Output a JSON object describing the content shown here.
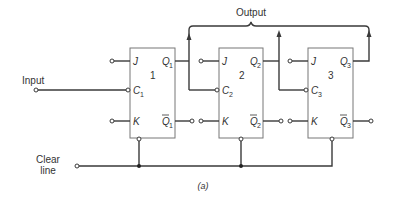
{
  "diagram": {
    "title": "Output",
    "caption": "(a)",
    "input_label": "Input",
    "clear_label_line1": "Clear",
    "clear_label_line2": "line",
    "flipflops": [
      {
        "number": "1",
        "j": "J",
        "c": "C",
        "c_sub": "1",
        "k": "K",
        "q": "Q",
        "q_sub": "1",
        "qbar": "Q",
        "qbar_sub": "1"
      },
      {
        "number": "2",
        "j": "J",
        "c": "C",
        "c_sub": "2",
        "k": "K",
        "q": "Q",
        "q_sub": "2",
        "qbar": "Q",
        "qbar_sub": "2"
      },
      {
        "number": "3",
        "j": "J",
        "c": "C",
        "c_sub": "3",
        "k": "K",
        "q": "Q",
        "q_sub": "3",
        "qbar": "Q",
        "qbar_sub": "3"
      }
    ],
    "colors": {
      "wire": "#3a3a3a",
      "box": "#777777",
      "text": "#333333"
    }
  }
}
